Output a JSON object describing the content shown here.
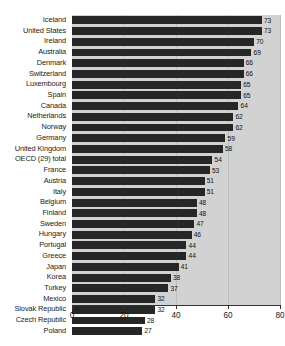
{
  "chart_data": {
    "type": "bar",
    "orientation": "horizontal",
    "title": "",
    "xlabel": "",
    "ylabel": "",
    "xlim": [
      0,
      80
    ],
    "xticks": [
      0,
      20,
      40,
      60,
      80
    ],
    "grid": true,
    "legend": null,
    "series_name": "value",
    "categories": [
      "Iceland",
      "United States",
      "Ireland",
      "Australia",
      "Denmark",
      "Switzerland",
      "Luxembourg",
      "Spain",
      "Canada",
      "Netherlands",
      "Norway",
      "Germany",
      "United Kingdom",
      "OECD (29) total",
      "France",
      "Austria",
      "Italy",
      "Belgium",
      "Finland",
      "Sweden",
      "Hungary",
      "Portugal",
      "Greece",
      "Japan",
      "Korea",
      "Turkey",
      "Mexico",
      "Slovak Republic",
      "Czech Republic",
      "Poland"
    ],
    "values": [
      73,
      73,
      70,
      69,
      66,
      66,
      65,
      65,
      64,
      62,
      62,
      59,
      58,
      54,
      53,
      51,
      51,
      48,
      48,
      47,
      46,
      44,
      44,
      41,
      38,
      37,
      32,
      32,
      28,
      27
    ],
    "colors": {
      "bar": "#262626",
      "plot_background": "#d2d2d2",
      "gridline": "#bdbdbd",
      "axis": "#333333",
      "text": "#1a1a1a"
    }
  },
  "x_tick_labels": [
    "0",
    "20",
    "40",
    "60",
    "80"
  ]
}
